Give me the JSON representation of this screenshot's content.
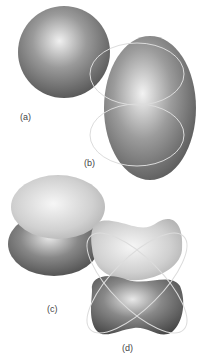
{
  "figure": {
    "panels": [
      {
        "id": "a",
        "label": "(a)",
        "shape": "sphere"
      },
      {
        "id": "b",
        "label": "(b)",
        "shape": "ellipsoid-with-two-lobe-outlines"
      },
      {
        "id": "c",
        "label": "(c)",
        "shape": "two-lobes-stacked"
      },
      {
        "id": "d",
        "label": "(d)",
        "shape": "four-lobe-cross-outline"
      }
    ],
    "colors": {
      "dark_gray": "#4a4a4a",
      "mid_gray": "#8a8a8a",
      "light_gray": "#c8c8c8",
      "outline": "#d8d8d8"
    }
  }
}
